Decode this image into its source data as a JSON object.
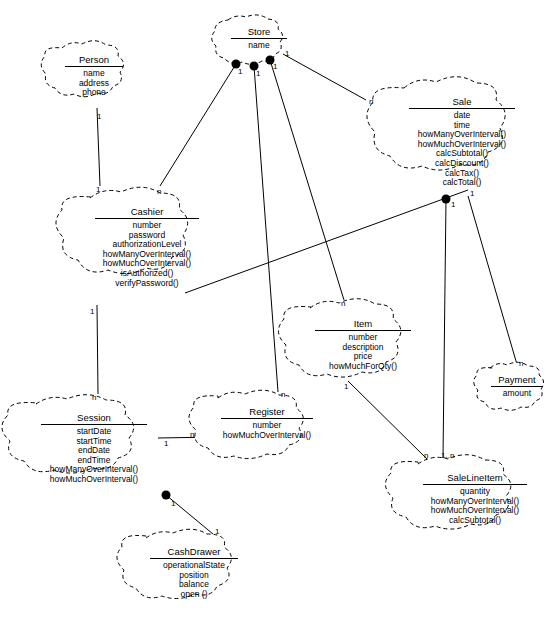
{
  "diagram": {
    "notation": "UML class diagram with cloud/blob shaped class boundaries",
    "stroke_color": "#000000",
    "background_color": "#ffffff"
  },
  "classes": [
    {
      "id": "store",
      "name": "Store",
      "members": [
        "name"
      ],
      "x": 222,
      "y": 22,
      "w": 74,
      "h": 46
    },
    {
      "id": "person",
      "name": "Person",
      "members": [
        "name",
        "address",
        "phone"
      ],
      "x": 56,
      "y": 48,
      "w": 76,
      "h": 60
    },
    {
      "id": "sale",
      "name": "Sale",
      "members": [
        "date",
        "time",
        "howManyOverInterval()",
        "howMuchOverInterval()",
        "calcSubtotal()",
        "calcDiscount()",
        "calcTax()",
        "calcTotal()"
      ],
      "x": 398,
      "y": 88,
      "w": 128,
      "h": 104
    },
    {
      "id": "cashier",
      "name": "Cashier",
      "members": [
        "number",
        "password",
        "authorizationLevel",
        "howManyOverInterval()",
        "howMuchOverInterval()",
        "isAuthorized()",
        "verifyPassword()"
      ],
      "x": 84,
      "y": 198,
      "w": 126,
      "h": 96
    },
    {
      "id": "item",
      "name": "Item",
      "members": [
        "number",
        "description",
        "price",
        "howMuchForQty()"
      ],
      "x": 304,
      "y": 308,
      "w": 118,
      "h": 72
    },
    {
      "id": "payment",
      "name": "Payment",
      "members": [
        "amount"
      ],
      "x": 484,
      "y": 368,
      "w": 66,
      "h": 44
    },
    {
      "id": "session",
      "name": "Session",
      "members": [
        "startDate",
        "startTime",
        "endDate",
        "endTime",
        "howManyOverInterval()",
        "howMuchOverInterval()"
      ],
      "x": 30,
      "y": 404,
      "w": 128,
      "h": 84
    },
    {
      "id": "register",
      "name": "Register",
      "members": [
        "number",
        "howMuchOverInterval()"
      ],
      "x": 212,
      "y": 398,
      "w": 110,
      "h": 56
    },
    {
      "id": "salelineitem",
      "name": "SaleLineItem",
      "members": [
        "quantity",
        "howManyOverInterval()",
        "howMuchOverInterval()",
        "calcSubtotal()"
      ],
      "x": 412,
      "y": 464,
      "w": 126,
      "h": 72
    },
    {
      "id": "cashdrawer",
      "name": "CashDrawer",
      "members": [
        "operationalState",
        "position",
        "balance",
        "open ()"
      ],
      "x": 140,
      "y": 538,
      "w": 108,
      "h": 72
    }
  ],
  "associations": [
    {
      "from": "store",
      "to": "cashier",
      "from_mult": "1",
      "to_mult": "n",
      "marker": "filled-circle"
    },
    {
      "from": "store",
      "to": "register",
      "from_mult": "1",
      "to_mult": "n",
      "marker": "filled-circle"
    },
    {
      "from": "store",
      "to": "item",
      "from_mult": "1",
      "to_mult": "n",
      "marker": "filled-circle"
    },
    {
      "from": "store",
      "to": "sale",
      "from_mult": "1",
      "to_mult": "n",
      "marker": "none"
    },
    {
      "from": "person",
      "to": "cashier",
      "from_mult": "1",
      "to_mult": "1",
      "marker": "none"
    },
    {
      "from": "cashier",
      "to": "session",
      "from_mult": "1",
      "to_mult": "n",
      "marker": "none"
    },
    {
      "from": "session",
      "to": "register",
      "from_mult": "1",
      "to_mult": "n",
      "marker": "none"
    },
    {
      "from": "session",
      "to": "cashdrawer",
      "from_mult": "1",
      "to_mult": "1",
      "marker": "filled-circle"
    },
    {
      "from": "sale",
      "to": "salelineitem",
      "from_mult": "1",
      "to_mult": "1..n",
      "marker": "filled-circle"
    },
    {
      "from": "sale",
      "to": "payment",
      "from_mult": "1",
      "to_mult": "n",
      "marker": "none"
    },
    {
      "from": "item",
      "to": "salelineitem",
      "from_mult": "1",
      "to_mult": "n",
      "marker": "none"
    },
    {
      "from": "cashier",
      "to": "sale",
      "from_mult": "n",
      "to_mult": "1",
      "marker": "none"
    }
  ],
  "multiplicity_labels": [
    {
      "text": "1",
      "x": 238,
      "y": 68
    },
    {
      "text": "1",
      "x": 256,
      "y": 70
    },
    {
      "text": "1",
      "x": 273,
      "y": 63
    },
    {
      "text": "1",
      "x": 285,
      "y": 50
    },
    {
      "text": "n",
      "x": 369,
      "y": 98
    },
    {
      "text": "1",
      "x": 97,
      "y": 113
    },
    {
      "text": "1",
      "x": 96,
      "y": 186
    },
    {
      "text": "n",
      "x": 157,
      "y": 188
    },
    {
      "text": "1",
      "x": 90,
      "y": 308
    },
    {
      "text": "n",
      "x": 92,
      "y": 394
    },
    {
      "text": "n",
      "x": 281,
      "y": 391
    },
    {
      "text": "n",
      "x": 190,
      "y": 435
    },
    {
      "text": "1",
      "x": 164,
      "y": 440
    },
    {
      "text": "n",
      "x": 341,
      "y": 300
    },
    {
      "text": "1",
      "x": 344,
      "y": 383
    },
    {
      "text": "1",
      "x": 456,
      "y": 199
    },
    {
      "text": "1",
      "x": 469,
      "y": 191
    },
    {
      "text": "n",
      "x": 519,
      "y": 362
    },
    {
      "text": "n",
      "x": 425,
      "y": 454
    },
    {
      "text": "1..n",
      "x": 441,
      "y": 453
    },
    {
      "text": "1",
      "x": 170,
      "y": 500
    },
    {
      "text": "1",
      "x": 166,
      "y": 508
    },
    {
      "text": "1",
      "x": 213,
      "y": 529
    }
  ]
}
